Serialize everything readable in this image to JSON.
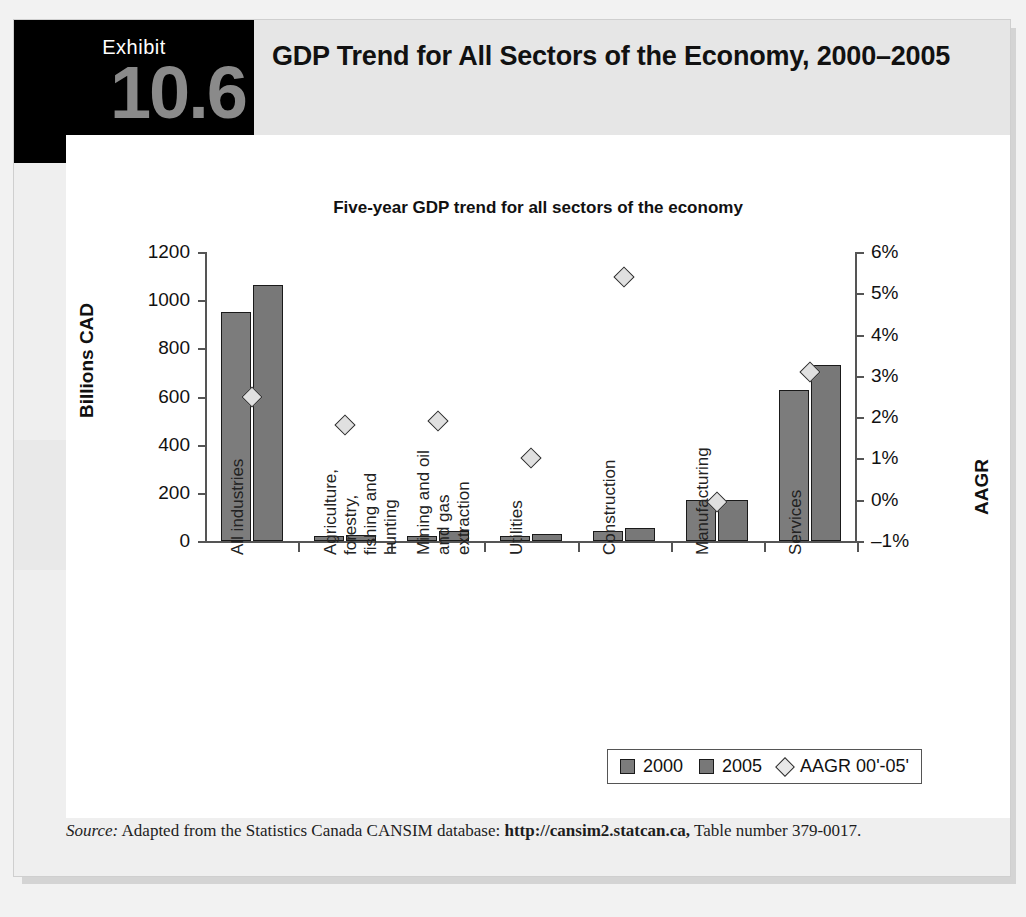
{
  "exhibit": {
    "label": "Exhibit",
    "number": "10.6",
    "title": "GDP Trend for All Sectors of the Economy, 2000–2005"
  },
  "source": {
    "prefix": "Source:",
    "text_before": " Adapted from the Statistics Canada CANSIM database: ",
    "url": "http://cansim2.statcan.ca,",
    "text_after": " Table number 379-0017."
  },
  "legend": {
    "items": [
      {
        "label": "2000",
        "marker": "square",
        "color": "#7c7c7c"
      },
      {
        "label": "2005",
        "marker": "square",
        "color": "#787878"
      },
      {
        "label": "AAGR 00'-05'",
        "marker": "diamond",
        "color": "#e8e8e8"
      }
    ]
  },
  "chart_data": {
    "type": "bar",
    "title": "Five-year GDP trend for all sectors of the economy",
    "xlabel": "",
    "ylabel": "Billions CAD",
    "y2label": "AAGR",
    "ylim": [
      0,
      1200
    ],
    "yticks": [
      "0",
      "200",
      "400",
      "600",
      "800",
      "1000",
      "1200"
    ],
    "ytickvalues": [
      0,
      200,
      400,
      600,
      800,
      1000,
      1200
    ],
    "y2lim": [
      -1,
      6
    ],
    "y2ticks": [
      "–1%",
      "0%",
      "1%",
      "2%",
      "3%",
      "4%",
      "5%",
      "6%"
    ],
    "y2tickvalues": [
      -1,
      0,
      1,
      2,
      3,
      4,
      5,
      6
    ],
    "grid": false,
    "legend_position": "bottom-right",
    "categories": [
      "All industries",
      "Agriculture, forestry, fishing and hunting",
      "Mining and oil and gas extraction",
      "Utilities",
      "Construction",
      "Manufacturing",
      "Services"
    ],
    "category_lines": [
      [
        "All industries"
      ],
      [
        "Agriculture,",
        "forestry,",
        "fishing and",
        "hunting"
      ],
      [
        "Mining and oil",
        "and gas",
        "extraction"
      ],
      [
        "Utilities"
      ],
      [
        "Construction"
      ],
      [
        "Manufacturing"
      ],
      [
        "Services"
      ]
    ],
    "series": [
      {
        "name": "2000",
        "axis": "left",
        "values": [
          950,
          22,
          22,
          20,
          40,
          172,
          625
        ]
      },
      {
        "name": "2005",
        "axis": "left",
        "values": [
          1065,
          23,
          40,
          30,
          55,
          172,
          730
        ]
      },
      {
        "name": "AAGR 00'-05'",
        "axis": "right",
        "type": "scatter",
        "values": [
          2.5,
          1.8,
          1.9,
          1.0,
          5.4,
          -0.05,
          3.1
        ]
      }
    ]
  }
}
